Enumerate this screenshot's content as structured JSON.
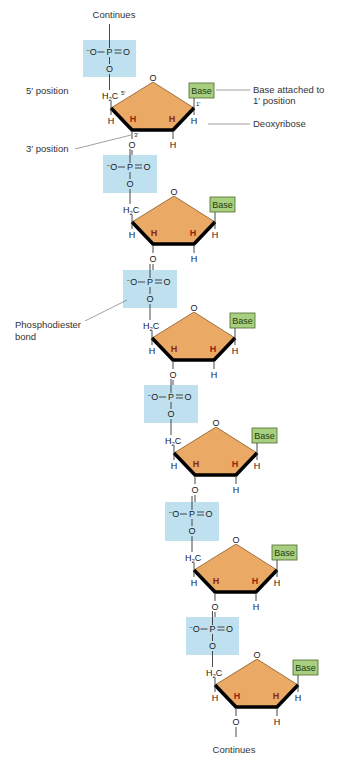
{
  "colors": {
    "phosphate_box": "#bfe0ef",
    "sugar_fill": "#eaa964",
    "sugar_edge": "#000000",
    "base_fill": "#a8cf80",
    "base_border": "#4a6a2a",
    "background": "#ffffff"
  },
  "labels": {
    "continues_top": "Continues",
    "continues_bottom": "Continues",
    "five_prime": "5′ position",
    "three_prime": "3′ position",
    "base_attached_line1": "Base attached to",
    "base_attached_line2": "1′ position",
    "deoxyribose": "Deoxyribose",
    "phosphodiester_line1": "Phosphodiester",
    "phosphodiester_line2": "bond"
  },
  "chem": {
    "phosphate_charge": "−",
    "phosphate_O_left": "O",
    "phosphate_P": "P",
    "phosphate_O_right": "O",
    "bridge_O": "O",
    "ring_O": "O",
    "h2c": "H",
    "h2c_sub": "2",
    "h2c_c": "C",
    "H": "H",
    "base": "Base",
    "pos_5": "5′",
    "pos_3": "3′",
    "pos_1": "1′"
  },
  "units": [
    {
      "index": 1,
      "phosphate_box": {
        "x": 83,
        "y": 40,
        "w": 53,
        "h": 37
      },
      "sugar_left": {
        "x": 111,
        "y": 108
      },
      "base_label": "Base"
    },
    {
      "index": 2,
      "phosphate_box": {
        "x": 103,
        "y": 155,
        "w": 54,
        "h": 38
      },
      "sugar_left": {
        "x": 132,
        "y": 222
      },
      "base_label": "Base"
    },
    {
      "index": 3,
      "phosphate_box": {
        "x": 123,
        "y": 270,
        "w": 54,
        "h": 38
      },
      "sugar_left": {
        "x": 152,
        "y": 338
      },
      "base_label": "Base"
    },
    {
      "index": 4,
      "phosphate_box": {
        "x": 144,
        "y": 385,
        "w": 54,
        "h": 38
      },
      "sugar_left": {
        "x": 174,
        "y": 453
      },
      "base_label": "Base"
    },
    {
      "index": 5,
      "phosphate_box": {
        "x": 165,
        "y": 502,
        "w": 54,
        "h": 39
      },
      "sugar_left": {
        "x": 194,
        "y": 570
      },
      "base_label": "Base"
    },
    {
      "index": 6,
      "phosphate_box": {
        "x": 186,
        "y": 617,
        "w": 53,
        "h": 38
      },
      "sugar_left": {
        "x": 215,
        "y": 685
      },
      "base_label": "Base"
    }
  ]
}
